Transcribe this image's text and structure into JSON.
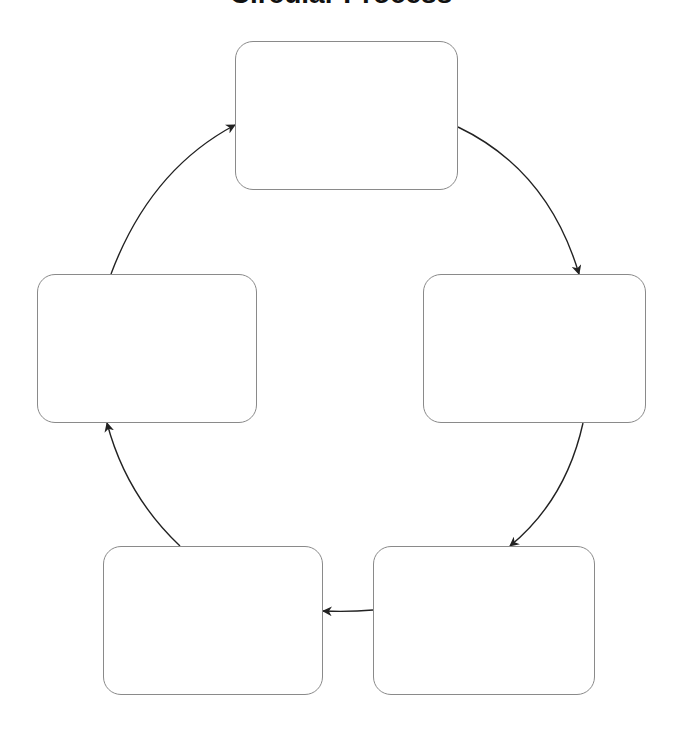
{
  "title": "Circular Process",
  "colors": {
    "background": "#ffffff",
    "node_border": "#8a8a8a",
    "arrow": "#222222",
    "title": "#111111"
  },
  "nodes": [
    {
      "id": "top",
      "label": ""
    },
    {
      "id": "right",
      "label": ""
    },
    {
      "id": "bottom-right",
      "label": ""
    },
    {
      "id": "bottom-left",
      "label": ""
    },
    {
      "id": "left",
      "label": ""
    }
  ],
  "edges": [
    {
      "from": "top",
      "to": "right"
    },
    {
      "from": "right",
      "to": "bottom-right"
    },
    {
      "from": "bottom-right",
      "to": "bottom-left"
    },
    {
      "from": "bottom-left",
      "to": "left"
    },
    {
      "from": "left",
      "to": "top"
    }
  ]
}
